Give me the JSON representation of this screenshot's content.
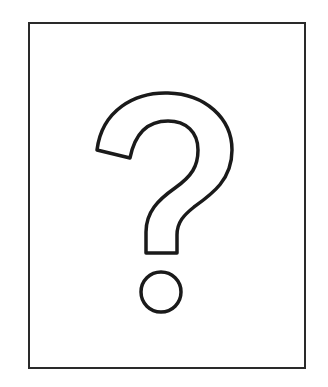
{
  "image": {
    "description": "Question mark symbol outlined inside a rectangular frame",
    "symbol": "question-mark",
    "icon": "question-mark-icon",
    "colors": {
      "background": "#ffffff",
      "stroke": "#1a1a1a",
      "frame": "#2a2a2a"
    }
  }
}
